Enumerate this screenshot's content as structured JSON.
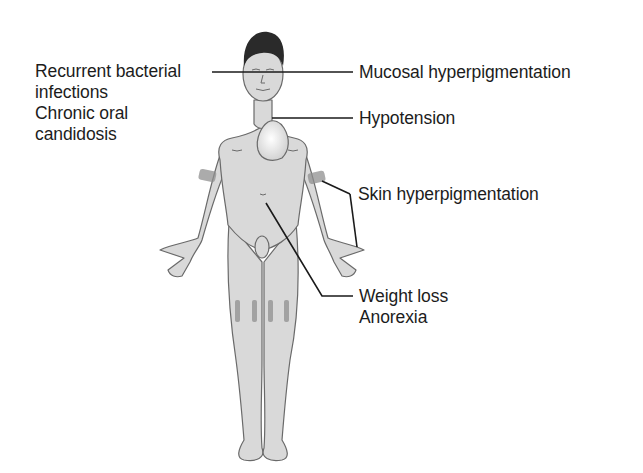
{
  "diagram": {
    "labels_left": [
      {
        "id": "recurrent-bacterial-infections",
        "lines": [
          "Recurrent bacterial",
          "infections"
        ]
      },
      {
        "id": "chronic-oral-candidosis",
        "lines": [
          "Chronic oral",
          "candidosis"
        ]
      }
    ],
    "labels_right": [
      {
        "id": "mucosal-hyperpigmentation",
        "text": "Mucosal hyperpigmentation"
      },
      {
        "id": "hypotension",
        "text": "Hypotension"
      },
      {
        "id": "skin-hyperpigmentation",
        "text": "Skin hyperpigmentation"
      },
      {
        "id": "weight-loss-anorexia",
        "lines": [
          "Weight loss",
          "Anorexia"
        ]
      }
    ],
    "colors": {
      "skin": "#d9d9d9",
      "outline": "#6a6a6a",
      "pigment": "#8f8f8f",
      "leader": "#1a1a1a",
      "hair": "#2a2a2a"
    }
  }
}
